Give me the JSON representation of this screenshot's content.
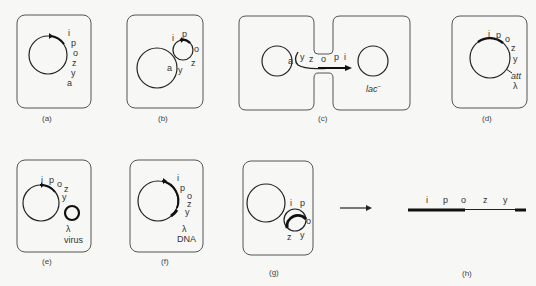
{
  "figure": {
    "panels": {
      "a": {
        "caption": "(a)",
        "genes": [
          "i",
          "p",
          "o",
          "z",
          "y",
          "a"
        ]
      },
      "b": {
        "caption": "(b)",
        "genes": [
          "i",
          "p",
          "o",
          "z",
          "y",
          "a"
        ]
      },
      "c": {
        "caption": "(c)",
        "genes": [
          "a",
          "y",
          "z",
          "o",
          "p",
          "i"
        ],
        "recipient_label": "lac",
        "recipient_superscript": "−"
      },
      "d": {
        "caption": "(d)",
        "genes": [
          "i",
          "p",
          "o",
          "z",
          "y"
        ],
        "att_label": "att",
        "lambda_label": "λ"
      },
      "e": {
        "caption": "(e)",
        "genes": [
          "i",
          "p",
          "o",
          "z",
          "y"
        ],
        "lambda_label": "λ",
        "virus_label": "virus"
      },
      "f": {
        "caption": "(f)",
        "genes": [
          "i",
          "p",
          "o",
          "z",
          "y"
        ],
        "lambda_label": "λ",
        "dna_label": "DNA"
      },
      "g": {
        "caption": "(g)",
        "genes": [
          "i",
          "p",
          "o",
          "z",
          "y"
        ]
      },
      "h": {
        "caption": "(h)",
        "genes": [
          "i",
          "p",
          "o",
          "z",
          "y"
        ]
      }
    }
  }
}
